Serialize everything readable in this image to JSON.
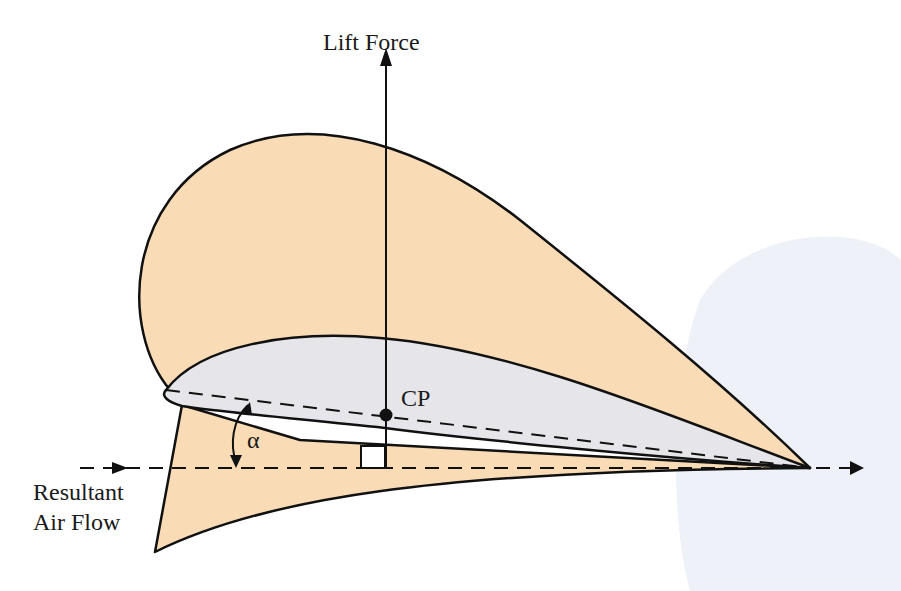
{
  "diagram": {
    "labels": {
      "lift_force": "Lift Force",
      "center_of_pressure": "CP",
      "angle_of_attack": "α",
      "resultant_air_flow_line1": "Resultant",
      "resultant_air_flow_line2": "Air Flow"
    },
    "colors": {
      "pressure_envelope": "#f9dcb6",
      "airfoil": "#e6e6ea",
      "stroke": "#111111",
      "background_tint": "#eef1f7"
    }
  }
}
